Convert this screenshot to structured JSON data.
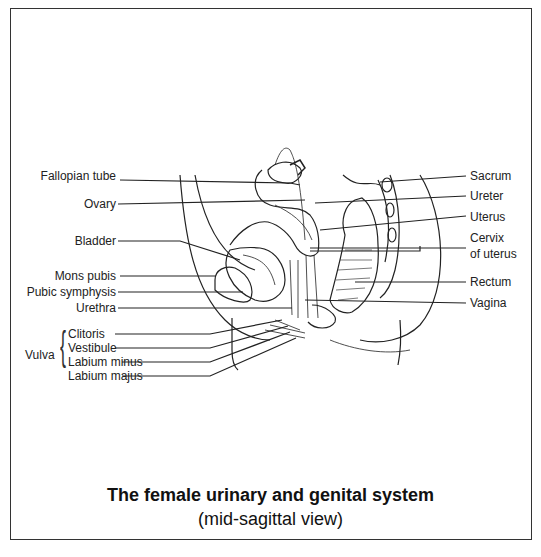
{
  "diagram": {
    "title_line1": "The female urinary and genital system",
    "title_line2": "(mid-sagittal view)",
    "left_labels": {
      "fallopian_tube": "Fallopian tube",
      "ovary": "Ovary",
      "bladder": "Bladder",
      "mons_pubis": "Mons pubis",
      "pubic_symphysis": "Pubic symphysis",
      "urethra": "Urethra"
    },
    "vulva": {
      "group_label": "Vulva",
      "parts": [
        "Clitoris",
        "Vestibule",
        "Labium minus",
        "Labium majus"
      ]
    },
    "right_labels": {
      "sacrum": "Sacrum",
      "ureter": "Ureter",
      "uterus": "Uterus",
      "cervix_line1": "Cervix",
      "cervix_line2": "of uterus",
      "rectum": "Rectum",
      "vagina": "Vagina"
    },
    "colors": {
      "line": "#222222",
      "frame": "#333333",
      "background": "#ffffff"
    }
  }
}
